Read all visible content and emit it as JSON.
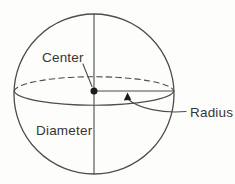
{
  "diagram": {
    "labels": {
      "center": "Center",
      "radius": "Radius",
      "diameter": "Diameter"
    },
    "colors": {
      "line": "#4d4d4d",
      "text": "#363636",
      "dot": "#1c1c1c",
      "background": "#fdfdfb"
    }
  }
}
